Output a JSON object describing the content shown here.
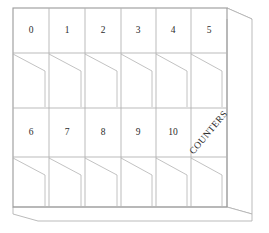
{
  "figure": {
    "name": "counters-shelf-cabinet",
    "background_color": "#ffffff",
    "line_color": "#b3b3b3",
    "line_color_dark": "#9a9a9a",
    "text_color": "#2b2b2b"
  },
  "cabinet": {
    "columns": 6,
    "label_rows": 2,
    "shelf_rows": 2,
    "front_left_x": 13,
    "front_right_x": 227,
    "front_top_y": 8,
    "front_bottom_y": 207,
    "depth_dx": 25,
    "depth_dy": -7,
    "base_dy": 14,
    "column_edges": [
      13,
      49,
      85,
      121,
      156,
      191,
      227
    ],
    "row_label_top_y": 8,
    "row_label_top_bottom_y": 53,
    "row_shelf_top_bottom_y": 108,
    "row_label_mid_bottom_y": 157,
    "row_shelf_bottom_bottom_y": 207,
    "shelf_diagonal_drop": 17,
    "shelf_diagonal_run_fraction": 0.78
  },
  "labels": {
    "row_one": [
      {
        "name": "cell-0",
        "text": "0"
      },
      {
        "name": "cell-1",
        "text": "1"
      },
      {
        "name": "cell-2",
        "text": "2"
      },
      {
        "name": "cell-3",
        "text": "3"
      },
      {
        "name": "cell-4",
        "text": "4"
      },
      {
        "name": "cell-5",
        "text": "5"
      }
    ],
    "row_two": [
      {
        "name": "cell-6",
        "text": "6"
      },
      {
        "name": "cell-7",
        "text": "7"
      },
      {
        "name": "cell-8",
        "text": "8"
      },
      {
        "name": "cell-9",
        "text": "9"
      },
      {
        "name": "cell-10",
        "text": "10"
      }
    ],
    "annotation": {
      "name": "counters-annotation",
      "text": "COUNTERS",
      "rotation_degrees": -50
    }
  }
}
